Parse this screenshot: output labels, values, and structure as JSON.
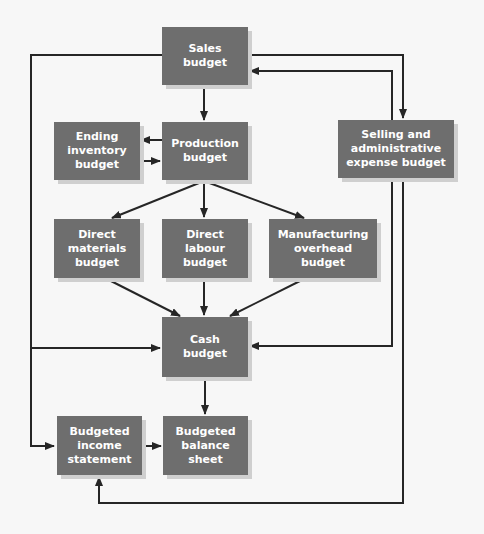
{
  "diagram": {
    "type": "flowchart",
    "colors": {
      "box_fill": "#6e6e6e",
      "box_text": "#ffffff",
      "line": "#262626",
      "background": "#f7f7f7"
    },
    "nodes": {
      "sales": "Sales\nbudget",
      "production": "Production\nbudget",
      "ending_inventory": "Ending\ninventory\nbudget",
      "selling_admin": "Selling and\nadministrative\nexpense budget",
      "direct_materials": "Direct\nmaterials\nbudget",
      "direct_labour": "Direct\nlabour\nbudget",
      "manufacturing_overhead": "Manufacturing\noverhead\nbudget",
      "cash": "Cash\nbudget",
      "income_statement": "Budgeted\nincome\nstatement",
      "balance_sheet": "Budgeted\nbalance\nsheet"
    },
    "edges": [
      {
        "from": "sales",
        "to": "production"
      },
      {
        "from": "sales",
        "to": "selling_admin"
      },
      {
        "from": "selling_admin",
        "to": "sales"
      },
      {
        "from": "production",
        "to": "ending_inventory"
      },
      {
        "from": "ending_inventory",
        "to": "production"
      },
      {
        "from": "production",
        "to": "direct_materials"
      },
      {
        "from": "production",
        "to": "direct_labour"
      },
      {
        "from": "production",
        "to": "manufacturing_overhead"
      },
      {
        "from": "direct_materials",
        "to": "cash"
      },
      {
        "from": "direct_labour",
        "to": "cash"
      },
      {
        "from": "manufacturing_overhead",
        "to": "cash"
      },
      {
        "from": "sales",
        "to": "cash"
      },
      {
        "from": "sales",
        "to": "income_statement"
      },
      {
        "from": "selling_admin",
        "to": "cash"
      },
      {
        "from": "selling_admin",
        "to": "income_statement"
      },
      {
        "from": "cash",
        "to": "balance_sheet"
      },
      {
        "from": "income_statement",
        "to": "balance_sheet"
      }
    ]
  }
}
